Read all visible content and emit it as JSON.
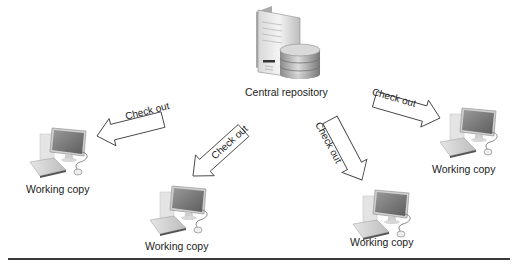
{
  "diagram": {
    "type": "centralized-version-control",
    "central": {
      "label": "Central repository",
      "icon": "server-database-icon"
    },
    "arrows": [
      {
        "label": "Check out",
        "direction": "to-left-working-copy"
      },
      {
        "label": "Check out",
        "direction": "to-bottom-left-working-copy"
      },
      {
        "label": "Check out",
        "direction": "to-bottom-right-working-copy"
      },
      {
        "label": "Check out",
        "direction": "to-right-working-copy"
      }
    ],
    "working_copies": [
      {
        "label": "Working copy",
        "icon": "desktop-computer-icon"
      },
      {
        "label": "Working copy",
        "icon": "desktop-computer-icon"
      },
      {
        "label": "Working copy",
        "icon": "desktop-computer-icon"
      },
      {
        "label": "Working copy",
        "icon": "desktop-computer-icon"
      }
    ]
  }
}
